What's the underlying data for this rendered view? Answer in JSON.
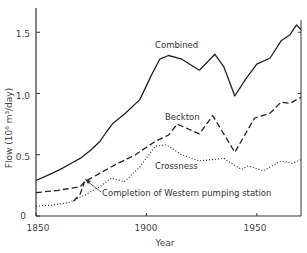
{
  "chart_data": {
    "type": "line",
    "title": "",
    "xlabel": "Year",
    "ylabel": "Flow (10⁶ m³/day)",
    "xlim": [
      1850,
      1970
    ],
    "ylim": [
      0,
      1.65
    ],
    "xticks": [
      1850,
      1900,
      1950
    ],
    "xtick_labels": [
      "1850",
      "1900",
      "1950"
    ],
    "yticks": [
      0,
      0.5,
      1.0,
      1.5
    ],
    "ytick_labels": [
      "0",
      "0.5",
      "1.0",
      "1.5"
    ],
    "grid": false,
    "legend": "inline labels",
    "series": [
      {
        "name": "Combined",
        "style": "solid",
        "points": [
          [
            1850,
            0.29
          ],
          [
            1855,
            0.33
          ],
          [
            1861,
            0.38
          ],
          [
            1866,
            0.43
          ],
          [
            1870,
            0.47
          ],
          [
            1875,
            0.54
          ],
          [
            1879,
            0.61
          ],
          [
            1882,
            0.69
          ],
          [
            1885,
            0.76
          ],
          [
            1890,
            0.83
          ],
          [
            1897,
            0.95
          ],
          [
            1902,
            1.14
          ],
          [
            1906,
            1.28
          ],
          [
            1910,
            1.31
          ],
          [
            1916,
            1.28
          ],
          [
            1924,
            1.19
          ],
          [
            1931,
            1.32
          ],
          [
            1935,
            1.22
          ],
          [
            1940,
            0.98
          ],
          [
            1945,
            1.12
          ],
          [
            1950,
            1.24
          ],
          [
            1956,
            1.29
          ],
          [
            1961,
            1.43
          ],
          [
            1965,
            1.48
          ],
          [
            1968,
            1.56
          ],
          [
            1970,
            1.52
          ]
        ]
      },
      {
        "name": "Beckton",
        "style": "dashed",
        "points": [
          [
            1850,
            0.19
          ],
          [
            1860,
            0.21
          ],
          [
            1870,
            0.24
          ],
          [
            1872,
            0.28
          ],
          [
            1880,
            0.36
          ],
          [
            1886,
            0.42
          ],
          [
            1895,
            0.5
          ],
          [
            1904,
            0.61
          ],
          [
            1910,
            0.66
          ],
          [
            1914,
            0.75
          ],
          [
            1924,
            0.67
          ],
          [
            1930,
            0.82
          ],
          [
            1940,
            0.52
          ],
          [
            1949,
            0.8
          ],
          [
            1956,
            0.84
          ],
          [
            1961,
            0.93
          ],
          [
            1965,
            0.92
          ],
          [
            1970,
            0.97
          ]
        ]
      },
      {
        "name": "Western (short segment)",
        "style": "dashed",
        "points": [
          [
            1867,
            0.12
          ],
          [
            1870,
            0.18
          ],
          [
            1872,
            0.28
          ]
        ]
      },
      {
        "name": "Crossness",
        "style": "dotted",
        "points": [
          [
            1850,
            0.08
          ],
          [
            1858,
            0.09
          ],
          [
            1865,
            0.11
          ],
          [
            1872,
            0.17
          ],
          [
            1879,
            0.24
          ],
          [
            1884,
            0.31
          ],
          [
            1890,
            0.28
          ],
          [
            1897,
            0.4
          ],
          [
            1904,
            0.57
          ],
          [
            1909,
            0.58
          ],
          [
            1916,
            0.5
          ],
          [
            1924,
            0.45
          ],
          [
            1935,
            0.47
          ],
          [
            1943,
            0.38
          ],
          [
            1946,
            0.41
          ],
          [
            1953,
            0.37
          ],
          [
            1961,
            0.45
          ],
          [
            1966,
            0.43
          ],
          [
            1970,
            0.46
          ]
        ]
      }
    ],
    "annotations": [
      {
        "text": "Completion of Western pumping station",
        "x": 1872,
        "y": 0.28,
        "arrow": true
      }
    ]
  },
  "labels": {
    "combined": "Combined",
    "beckton": "Beckton",
    "crossness": "Crossness",
    "annotation": "Completion of Western pumping station",
    "xlabel": "Year",
    "ylabel": "Flow (10⁶ m³/day)",
    "x1850": "1850",
    "x1900": "1900",
    "x1950": "1950",
    "y0": "0",
    "y05": "0.5",
    "y10": "1.0",
    "y15": "1.5"
  }
}
